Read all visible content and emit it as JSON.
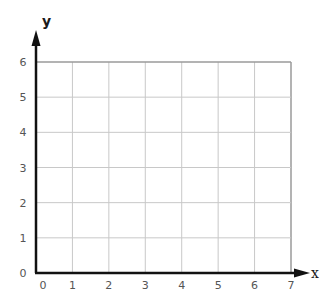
{
  "chart_data": {
    "type": "scatter",
    "title": "",
    "xlabel": "x",
    "ylabel": "y",
    "xlim": [
      0,
      7
    ],
    "ylim": [
      0,
      6
    ],
    "x_ticks": [
      "0",
      "1",
      "2",
      "3",
      "4",
      "5",
      "6",
      "7"
    ],
    "y_ticks": [
      "0",
      "1",
      "2",
      "3",
      "4",
      "5",
      "6"
    ],
    "grid": true,
    "series": [],
    "legend": null
  },
  "colors": {
    "grid": "#c8c8c8",
    "border": "#9a9a9a",
    "axis": "#111111",
    "tick_text": "#555555"
  },
  "layout": {
    "origin_px": [
      36,
      273
    ],
    "x_max_px": 291,
    "y_max_px": 62
  }
}
